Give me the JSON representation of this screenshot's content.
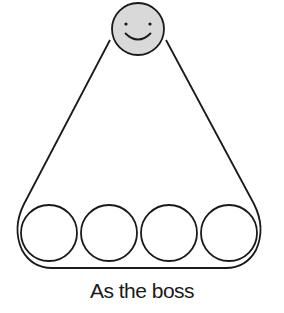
{
  "diagram": {
    "caption": "As the boss",
    "top_node": {
      "type": "smiley-face",
      "fill": "#d9d9d9"
    },
    "bottom_nodes": [
      {
        "type": "empty-circle"
      },
      {
        "type": "empty-circle"
      },
      {
        "type": "empty-circle"
      },
      {
        "type": "empty-circle"
      }
    ],
    "colors": {
      "stroke": "#1a1a1a",
      "face_fill": "#d9d9d9",
      "background": "#ffffff"
    }
  }
}
